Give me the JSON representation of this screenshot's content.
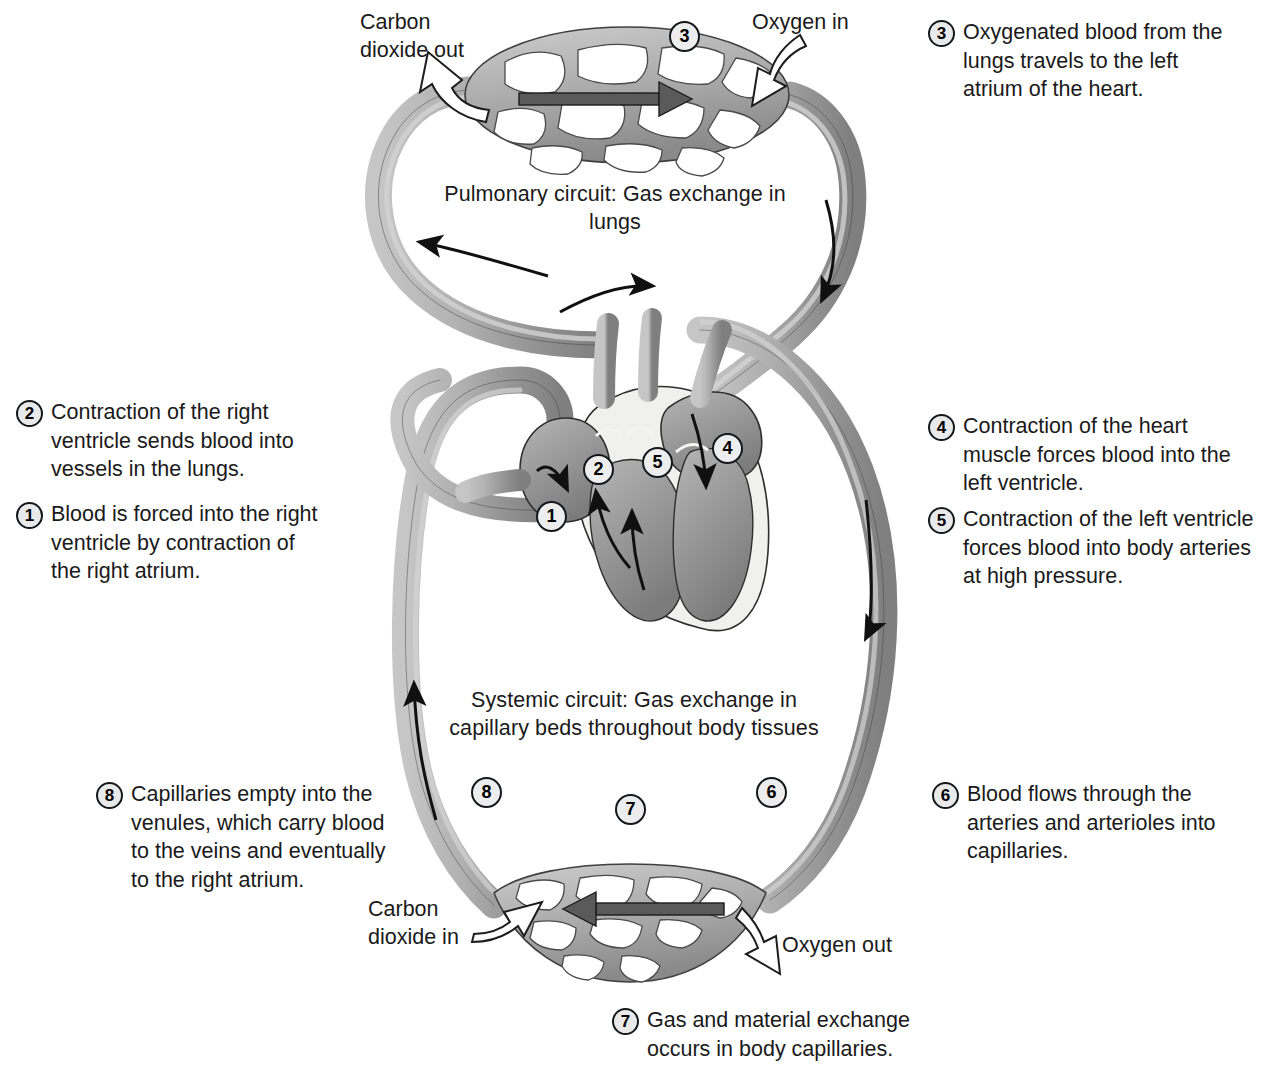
{
  "diagram": {
    "background_color": "#ffffff",
    "vessel_color": "#9b9b9b",
    "vessel_outline_color": "#3c3c3c",
    "badge_fill": "#e9e9e9",
    "badge_stroke": "#15181a",
    "arrow_dark": "#4a4a4a",
    "arrow_white": "#ffffff"
  },
  "circuit_captions": {
    "pulmonary": "Pulmonary circuit: Gas exchange in\nlungs",
    "systemic": "Systemic circuit: Gas exchange in\ncapillary beds throughout body tissues"
  },
  "gas_labels": {
    "co2_out": "Carbon\ndioxide out",
    "oxygen_in": "Oxygen in",
    "co2_in": "Carbon\ndioxide in",
    "oxygen_out": "Oxygen out"
  },
  "steps": [
    {
      "num": "1",
      "text": "Blood is forced into the right\nventricle by contraction of\nthe right atrium."
    },
    {
      "num": "2",
      "text": "Contraction of the right\nventricle sends blood into\nvessels in the lungs."
    },
    {
      "num": "3",
      "text": "Oxygenated blood from the\nlungs travels to the left\natrium of the heart."
    },
    {
      "num": "4",
      "text": "Contraction of the heart\nmuscle forces blood into the\nleft ventricle."
    },
    {
      "num": "5",
      "text": "Contraction of the left ventricle\nforces blood into body arteries\nat high pressure."
    },
    {
      "num": "6",
      "text": "Blood flows through the\narteries and arterioles into\ncapillaries."
    },
    {
      "num": "7",
      "text": "Gas and material exchange\noccurs in body capillaries."
    },
    {
      "num": "8",
      "text": "Capillaries empty into the\nvenules, which carry blood\nto the veins and eventually\nto the right atrium."
    }
  ],
  "markers": [
    {
      "num": "3",
      "location": "lung-capillary-bed"
    },
    {
      "num": "1",
      "location": "right-atrium"
    },
    {
      "num": "2",
      "location": "right-ventricle-outflow"
    },
    {
      "num": "5",
      "location": "left-ventricle"
    },
    {
      "num": "4",
      "location": "left-atrium"
    },
    {
      "num": "8",
      "location": "venule-return-left"
    },
    {
      "num": "7",
      "location": "body-capillary-bed"
    },
    {
      "num": "6",
      "location": "artery-descent-right"
    }
  ]
}
